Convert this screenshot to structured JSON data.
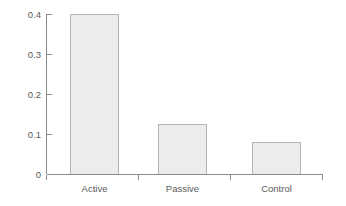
{
  "chart_data": {
    "type": "bar",
    "title": "",
    "subtitle": "",
    "xlabel": "",
    "ylabel": "",
    "categories": [
      "Active",
      "Passive",
      "Control"
    ],
    "values": [
      0.4,
      0.125,
      0.08
    ],
    "series": [
      {
        "name": "",
        "values": [
          0.4,
          0.125,
          0.08
        ]
      }
    ],
    "ylim": [
      0,
      0.4
    ],
    "y_ticks": [
      0,
      0.1,
      0.2,
      0.3,
      0.4
    ],
    "y_tick_labels": [
      "0",
      "0.1",
      "0.2",
      "0.3",
      "0.4"
    ],
    "x_tick_labels": [
      "Active",
      "Passive",
      "Control"
    ],
    "grid": false,
    "legend": false,
    "legend_position": "none",
    "annotations": [],
    "colors": {
      "bar_fill": "#ececec",
      "bar_border": "#b4b4b4",
      "axis": "#8c8c8c",
      "text": "#5a5a5a",
      "background": "#ffffff"
    }
  }
}
